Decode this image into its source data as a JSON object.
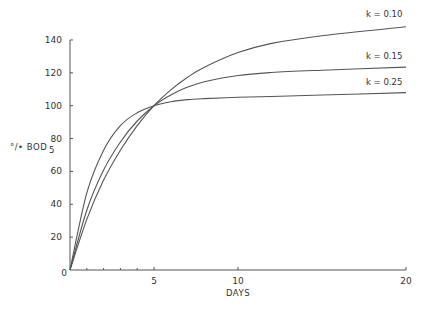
{
  "chart_data": {
    "type": "line",
    "title": "",
    "xlabel": "DAYS",
    "ylabel": "% BOD5",
    "ylabel_main": "°/• BOD",
    "ylabel_sub": "5",
    "xlim": [
      0,
      20
    ],
    "ylim": [
      0,
      140
    ],
    "x_ticks": [
      0,
      5,
      10,
      20
    ],
    "x_tick_labels": [
      "0",
      "5",
      "10",
      "20"
    ],
    "x_minor_ticks": [
      1,
      2,
      3,
      4
    ],
    "y_ticks": [
      20,
      40,
      60,
      80,
      100,
      120,
      140
    ],
    "y_tick_labels": [
      "20",
      "40",
      "60",
      "80",
      "100",
      "120",
      "140"
    ],
    "grid": false,
    "legend": "inline labels at curve ends",
    "x": [
      0,
      1,
      2,
      3,
      4,
      5,
      6,
      7,
      8,
      10,
      12,
      15,
      20
    ],
    "series": [
      {
        "name": "k = 0.10",
        "values": [
          0,
          30.8,
          54.7,
          72.9,
          87.8,
          100,
          109.6,
          117.3,
          123.4,
          132.3,
          137.9,
          142.6,
          148
        ]
      },
      {
        "name": "k = 0.15",
        "values": [
          0,
          36.4,
          60.8,
          77.9,
          90.7,
          100,
          106.6,
          111.3,
          114.6,
          118.4,
          120.2,
          121.6,
          123.5
        ]
      },
      {
        "name": "k = 0.25",
        "values": [
          0,
          46.9,
          72.9,
          87.9,
          95.7,
          100,
          102.4,
          103.7,
          104.3,
          105.1,
          105.6,
          106.5,
          108
        ]
      }
    ]
  },
  "labels": {
    "origin": "0",
    "series_labels": [
      "k = 0.10",
      "k = 0.15",
      "k = 0.25"
    ]
  }
}
